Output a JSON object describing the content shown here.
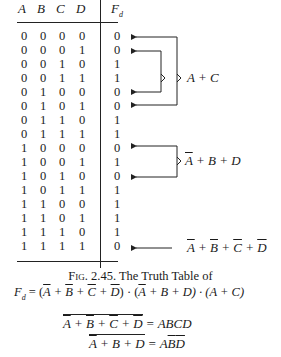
{
  "table": {
    "headers": [
      "A",
      "B",
      "C",
      "D"
    ],
    "output_header": "F",
    "output_subscript": "d",
    "rows": [
      {
        "inputs": [
          "0",
          "0",
          "0",
          "0"
        ],
        "output": "0"
      },
      {
        "inputs": [
          "0",
          "0",
          "0",
          "1"
        ],
        "output": "0"
      },
      {
        "inputs": [
          "0",
          "0",
          "1",
          "0"
        ],
        "output": "1"
      },
      {
        "inputs": [
          "0",
          "0",
          "1",
          "1"
        ],
        "output": "1"
      },
      {
        "inputs": [
          "0",
          "1",
          "0",
          "0"
        ],
        "output": "0"
      },
      {
        "inputs": [
          "0",
          "1",
          "0",
          "1"
        ],
        "output": "0"
      },
      {
        "inputs": [
          "0",
          "1",
          "1",
          "0"
        ],
        "output": "1"
      },
      {
        "inputs": [
          "0",
          "1",
          "1",
          "1"
        ],
        "output": "1"
      },
      {
        "inputs": [
          "1",
          "0",
          "0",
          "0"
        ],
        "output": "0"
      },
      {
        "inputs": [
          "1",
          "0",
          "0",
          "1"
        ],
        "output": "1"
      },
      {
        "inputs": [
          "1",
          "0",
          "1",
          "0"
        ],
        "output": "0"
      },
      {
        "inputs": [
          "1",
          "0",
          "1",
          "1"
        ],
        "output": "1"
      },
      {
        "inputs": [
          "1",
          "1",
          "0",
          "0"
        ],
        "output": "1"
      },
      {
        "inputs": [
          "1",
          "1",
          "0",
          "1"
        ],
        "output": "1"
      },
      {
        "inputs": [
          "1",
          "1",
          "1",
          "0"
        ],
        "output": "1"
      },
      {
        "inputs": [
          "1",
          "1",
          "1",
          "1"
        ],
        "output": "0"
      }
    ]
  },
  "annotations": {
    "group1": {
      "label": "A + C",
      "rows": [
        0,
        1,
        4,
        5
      ]
    },
    "group2": {
      "label_bar": "A",
      "label_rest": " + B + D",
      "rows": [
        8,
        10
      ]
    },
    "group3": {
      "terms": [
        "A",
        "B",
        "C",
        "D"
      ],
      "separator": " + ",
      "rows": [
        15
      ]
    }
  },
  "caption": {
    "line1_prefix": "Fig.",
    "line1_rest": " 2.45.  The Truth Table of",
    "line2_lhs": "F",
    "line2_sub": "d",
    "line2_eq": " = (",
    "line2_t1": [
      "A",
      "B",
      "C",
      "D"
    ],
    "line2_mid": ") · (",
    "line2_t2_bar": "A",
    "line2_t2_rest": " + B + D) · (A + C)"
  },
  "equations": [
    {
      "lhs_overbar": "Ā + B̄ + C̄ + D̄",
      "rhs": "ABCD"
    },
    {
      "lhs_overbar": "Ā + B + D",
      "rhs_plain": "A",
      "rhs_bar": [
        "B",
        "D"
      ]
    }
  ]
}
